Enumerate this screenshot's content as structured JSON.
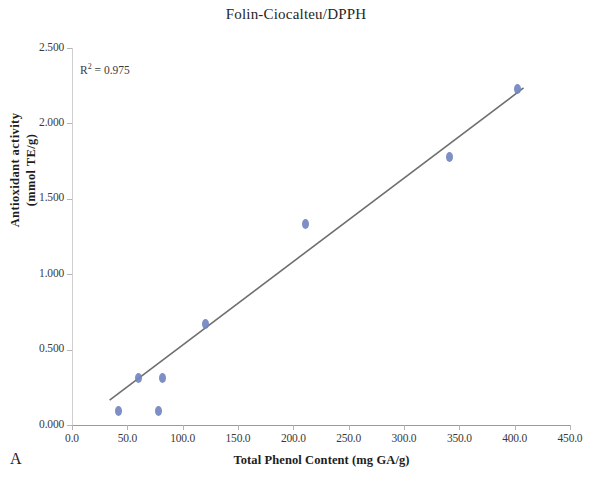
{
  "panel": {
    "label": "A"
  },
  "chart_data": {
    "type": "scatter",
    "title": "Folin-Ciocalteu/DPPH",
    "xlabel": "Total Phenol Content (mg GA/g)",
    "ylabel_line1": "Antioxidant activity",
    "ylabel_line2": "(mmol TE/g)",
    "xlim": [
      0.0,
      450.0
    ],
    "ylim": [
      0.0,
      2.5
    ],
    "xticks": [
      "0.0",
      "50.0",
      "100.0",
      "150.0",
      "200.0",
      "250.0",
      "300.0",
      "350.0",
      "400.0",
      "450.0"
    ],
    "xtick_values": [
      0,
      50,
      100,
      150,
      200,
      250,
      300,
      350,
      400,
      450
    ],
    "yticks": [
      "0.000",
      "0.500",
      "1.000",
      "1.500",
      "2.000",
      "2.500"
    ],
    "ytick_values": [
      0.0,
      0.5,
      1.0,
      1.5,
      2.0,
      2.5
    ],
    "grid": false,
    "legend": "none",
    "marker_color": "#7386c0",
    "trendline_color": "#6e6e6e",
    "annotation": "R² = 0.975",
    "annotation_base": "R",
    "annotation_sup": "2",
    "annotation_rest": " = 0.975",
    "r_squared": 0.975,
    "points": [
      {
        "x": 42,
        "y": 0.09
      },
      {
        "x": 60,
        "y": 0.31
      },
      {
        "x": 78,
        "y": 0.09
      },
      {
        "x": 82,
        "y": 0.31
      },
      {
        "x": 121,
        "y": 0.67
      },
      {
        "x": 211,
        "y": 1.33
      },
      {
        "x": 341,
        "y": 1.78
      },
      {
        "x": 403,
        "y": 2.23
      }
    ],
    "trendline": {
      "x1": 34,
      "y1": 0.165,
      "x2": 408,
      "y2": 2.235
    }
  }
}
